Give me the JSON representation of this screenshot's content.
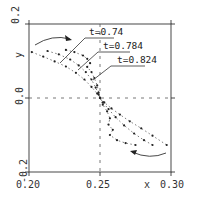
{
  "chart_data": {
    "type": "line",
    "title": "",
    "xlabel": "x",
    "ylabel": "y",
    "xlim": [
      0.2,
      0.3
    ],
    "ylim": [
      -0.2,
      0.2
    ],
    "xticks": [
      "0.20",
      "0.25",
      "0.30"
    ],
    "yticks": [
      "-0.2",
      "0.0",
      "0.2"
    ],
    "grid": false,
    "reference_lines": {
      "x": 0.25,
      "y": 0.0,
      "style": "dashed"
    },
    "series": [
      {
        "name": "t=0.74",
        "style": "dotted-markers",
        "points": [
          [
            0.202,
            0.124
          ],
          [
            0.21,
            0.112
          ],
          [
            0.218,
            0.099
          ],
          [
            0.226,
            0.085
          ],
          [
            0.233,
            0.068
          ],
          [
            0.239,
            0.05
          ],
          [
            0.244,
            0.03
          ],
          [
            0.248,
            0.012
          ],
          [
            0.25,
            0.0
          ],
          [
            0.253,
            -0.012
          ],
          [
            0.258,
            -0.028
          ],
          [
            0.264,
            -0.045
          ],
          [
            0.271,
            -0.063
          ],
          [
            0.279,
            -0.082
          ],
          [
            0.287,
            -0.102
          ],
          [
            0.297,
            -0.127
          ]
        ]
      },
      {
        "name": "t=0.784",
        "style": "dotted-markers",
        "points": [
          [
            0.213,
            0.127
          ],
          [
            0.221,
            0.118
          ],
          [
            0.229,
            0.104
          ],
          [
            0.235,
            0.088
          ],
          [
            0.24,
            0.07
          ],
          [
            0.244,
            0.05
          ],
          [
            0.247,
            0.028
          ],
          [
            0.249,
            0.01
          ],
          [
            0.25,
            0.0
          ],
          [
            0.252,
            -0.012
          ],
          [
            0.256,
            -0.03
          ],
          [
            0.261,
            -0.052
          ],
          [
            0.267,
            -0.074
          ],
          [
            0.274,
            -0.096
          ],
          [
            0.281,
            -0.114
          ],
          [
            0.287,
            -0.127
          ]
        ]
      },
      {
        "name": "t=0.824",
        "style": "dotted-markers",
        "points": [
          [
            0.226,
            0.13
          ],
          [
            0.232,
            0.124
          ],
          [
            0.238,
            0.115
          ],
          [
            0.241,
            0.106
          ],
          [
            0.243,
            0.094
          ],
          [
            0.241,
            0.084
          ],
          [
            0.244,
            0.07
          ],
          [
            0.246,
            0.054
          ],
          [
            0.248,
            0.034
          ],
          [
            0.249,
            0.015
          ],
          [
            0.25,
            0.0
          ],
          [
            0.252,
            -0.018
          ],
          [
            0.255,
            -0.036
          ],
          [
            0.257,
            -0.055
          ],
          [
            0.256,
            -0.072
          ],
          [
            0.259,
            -0.086
          ],
          [
            0.257,
            -0.1
          ],
          [
            0.262,
            -0.114
          ],
          [
            0.268,
            -0.122
          ],
          [
            0.275,
            -0.127
          ]
        ]
      }
    ],
    "annotations": [
      {
        "text": "t=0.74",
        "label_pos": [
          0.237,
          0.177
        ],
        "points_to_series": "t=0.74"
      },
      {
        "text": "t=0.784",
        "label_pos": [
          0.246,
          0.147
        ],
        "points_to_series": "t=0.784"
      },
      {
        "text": "t=0.824",
        "label_pos": [
          0.256,
          0.117
        ],
        "points_to_series": "t=0.824"
      },
      {
        "text": "",
        "type": "curved-arrow",
        "direction": "right",
        "location": "upper-left"
      },
      {
        "text": "",
        "type": "curved-arrow",
        "direction": "left",
        "location": "lower-right"
      }
    ],
    "legend": null
  },
  "axes": {
    "x_label": "x",
    "y_label": "y",
    "x_ticks": [
      "0.20",
      "0.25",
      "0.30"
    ],
    "y_ticks": [
      "-0.2",
      "0.0",
      "0.2"
    ]
  },
  "labels": {
    "t1": "t=0.74",
    "t2": "t=0.784",
    "t3": "t=0.824"
  }
}
